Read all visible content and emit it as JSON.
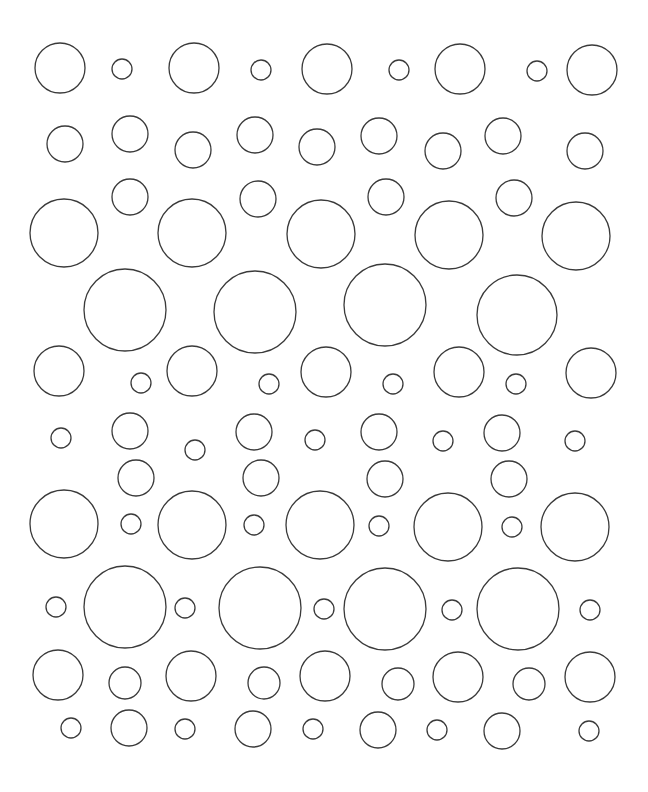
{
  "canvas": {
    "width": 648,
    "height": 792,
    "background": "#ffffff",
    "stroke_color": "#3a3a3a"
  },
  "pattern": {
    "description": "Polka-dot circle outline pattern",
    "circles": [
      {
        "cx": 60,
        "cy": 68,
        "r": 25
      },
      {
        "cx": 122,
        "cy": 69,
        "r": 10
      },
      {
        "cx": 194,
        "cy": 68,
        "r": 25
      },
      {
        "cx": 261,
        "cy": 70,
        "r": 10
      },
      {
        "cx": 327,
        "cy": 69,
        "r": 25
      },
      {
        "cx": 399,
        "cy": 70,
        "r": 10
      },
      {
        "cx": 460,
        "cy": 69,
        "r": 25
      },
      {
        "cx": 537,
        "cy": 71,
        "r": 10
      },
      {
        "cx": 592,
        "cy": 70,
        "r": 25
      },
      {
        "cx": 65,
        "cy": 144,
        "r": 18
      },
      {
        "cx": 130,
        "cy": 134,
        "r": 18
      },
      {
        "cx": 193,
        "cy": 150,
        "r": 18
      },
      {
        "cx": 255,
        "cy": 135,
        "r": 18
      },
      {
        "cx": 317,
        "cy": 147,
        "r": 18
      },
      {
        "cx": 379,
        "cy": 136,
        "r": 18
      },
      {
        "cx": 443,
        "cy": 151,
        "r": 18
      },
      {
        "cx": 503,
        "cy": 136,
        "r": 18
      },
      {
        "cx": 585,
        "cy": 151,
        "r": 18
      },
      {
        "cx": 130,
        "cy": 197,
        "r": 18
      },
      {
        "cx": 258,
        "cy": 199,
        "r": 18
      },
      {
        "cx": 386,
        "cy": 197,
        "r": 18
      },
      {
        "cx": 514,
        "cy": 198,
        "r": 18
      },
      {
        "cx": 64,
        "cy": 233,
        "r": 34
      },
      {
        "cx": 192,
        "cy": 233,
        "r": 34
      },
      {
        "cx": 321,
        "cy": 234,
        "r": 34
      },
      {
        "cx": 449,
        "cy": 235,
        "r": 34
      },
      {
        "cx": 576,
        "cy": 236,
        "r": 34
      },
      {
        "cx": 125,
        "cy": 310,
        "r": 41
      },
      {
        "cx": 255,
        "cy": 312,
        "r": 41
      },
      {
        "cx": 385,
        "cy": 305,
        "r": 41
      },
      {
        "cx": 517,
        "cy": 315,
        "r": 40
      },
      {
        "cx": 59,
        "cy": 371,
        "r": 25
      },
      {
        "cx": 141,
        "cy": 383,
        "r": 10
      },
      {
        "cx": 192,
        "cy": 371,
        "r": 25
      },
      {
        "cx": 269,
        "cy": 384,
        "r": 10
      },
      {
        "cx": 326,
        "cy": 372,
        "r": 25
      },
      {
        "cx": 393,
        "cy": 384,
        "r": 10
      },
      {
        "cx": 459,
        "cy": 372,
        "r": 25
      },
      {
        "cx": 516,
        "cy": 384,
        "r": 10
      },
      {
        "cx": 591,
        "cy": 373,
        "r": 25
      },
      {
        "cx": 61,
        "cy": 438,
        "r": 10
      },
      {
        "cx": 130,
        "cy": 431,
        "r": 18
      },
      {
        "cx": 195,
        "cy": 450,
        "r": 10
      },
      {
        "cx": 254,
        "cy": 432,
        "r": 18
      },
      {
        "cx": 315,
        "cy": 440,
        "r": 10
      },
      {
        "cx": 379,
        "cy": 432,
        "r": 18
      },
      {
        "cx": 443,
        "cy": 441,
        "r": 10
      },
      {
        "cx": 502,
        "cy": 433,
        "r": 18
      },
      {
        "cx": 575,
        "cy": 441,
        "r": 10
      },
      {
        "cx": 136,
        "cy": 478,
        "r": 18
      },
      {
        "cx": 261,
        "cy": 478,
        "r": 18
      },
      {
        "cx": 385,
        "cy": 479,
        "r": 18
      },
      {
        "cx": 509,
        "cy": 479,
        "r": 18
      },
      {
        "cx": 64,
        "cy": 524,
        "r": 34
      },
      {
        "cx": 131,
        "cy": 524,
        "r": 10
      },
      {
        "cx": 192,
        "cy": 525,
        "r": 34
      },
      {
        "cx": 254,
        "cy": 525,
        "r": 10
      },
      {
        "cx": 320,
        "cy": 525,
        "r": 34
      },
      {
        "cx": 379,
        "cy": 526,
        "r": 10
      },
      {
        "cx": 448,
        "cy": 527,
        "r": 34
      },
      {
        "cx": 512,
        "cy": 527,
        "r": 10
      },
      {
        "cx": 575,
        "cy": 527,
        "r": 34
      },
      {
        "cx": 56,
        "cy": 607,
        "r": 10
      },
      {
        "cx": 125,
        "cy": 607,
        "r": 41
      },
      {
        "cx": 185,
        "cy": 608,
        "r": 10
      },
      {
        "cx": 260,
        "cy": 608,
        "r": 41
      },
      {
        "cx": 324,
        "cy": 609,
        "r": 10
      },
      {
        "cx": 385,
        "cy": 609,
        "r": 41
      },
      {
        "cx": 452,
        "cy": 610,
        "r": 10
      },
      {
        "cx": 518,
        "cy": 609,
        "r": 41
      },
      {
        "cx": 590,
        "cy": 610,
        "r": 10
      },
      {
        "cx": 58,
        "cy": 675,
        "r": 25
      },
      {
        "cx": 125,
        "cy": 683,
        "r": 16
      },
      {
        "cx": 191,
        "cy": 676,
        "r": 25
      },
      {
        "cx": 264,
        "cy": 683,
        "r": 16
      },
      {
        "cx": 325,
        "cy": 676,
        "r": 25
      },
      {
        "cx": 398,
        "cy": 684,
        "r": 16
      },
      {
        "cx": 458,
        "cy": 677,
        "r": 25
      },
      {
        "cx": 529,
        "cy": 684,
        "r": 16
      },
      {
        "cx": 590,
        "cy": 677,
        "r": 25
      },
      {
        "cx": 71,
        "cy": 728,
        "r": 10
      },
      {
        "cx": 129,
        "cy": 728,
        "r": 18
      },
      {
        "cx": 185,
        "cy": 729,
        "r": 10
      },
      {
        "cx": 253,
        "cy": 729,
        "r": 18
      },
      {
        "cx": 313,
        "cy": 729,
        "r": 10
      },
      {
        "cx": 378,
        "cy": 730,
        "r": 18
      },
      {
        "cx": 437,
        "cy": 730,
        "r": 10
      },
      {
        "cx": 502,
        "cy": 731,
        "r": 18
      },
      {
        "cx": 589,
        "cy": 731,
        "r": 10
      }
    ]
  }
}
